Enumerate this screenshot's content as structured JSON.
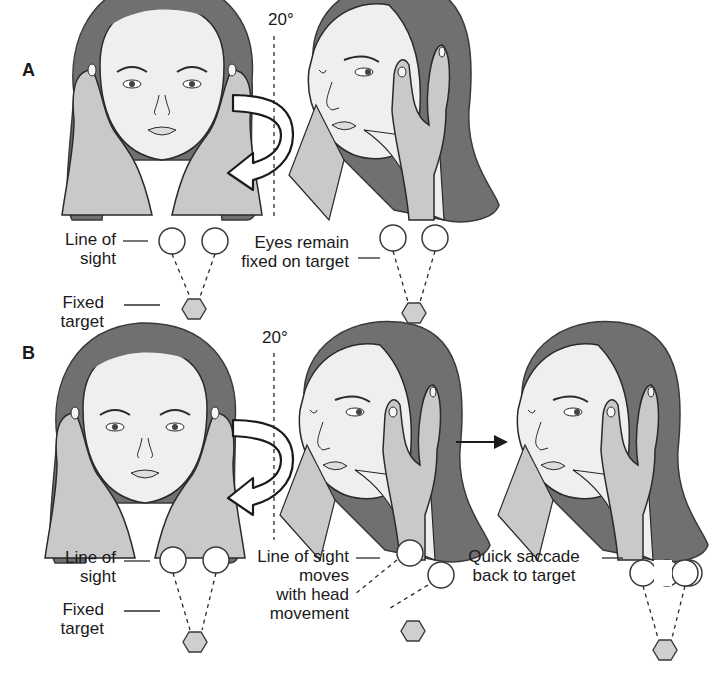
{
  "figure": {
    "panels": [
      {
        "id": "A",
        "letter": "A",
        "rotation_label": "20°",
        "labels": {
          "line_of_sight_1": "Line of",
          "line_of_sight_2": "sight",
          "fixed_target_1": "Fixed",
          "fixed_target_2": "target",
          "eyes_remain_1": "Eyes remain",
          "eyes_remain_2": "fixed on target"
        }
      },
      {
        "id": "B",
        "letter": "B",
        "rotation_label": "20°",
        "labels": {
          "line_of_sight_1": "Line of",
          "line_of_sight_2": "sight",
          "fixed_target_1": "Fixed",
          "fixed_target_2": "target",
          "moves_1": "Line of sight",
          "moves_2": "moves",
          "moves_3": "with head",
          "moves_4": "movement",
          "saccade_1": "Quick saccade",
          "saccade_2": "back to target"
        }
      }
    ],
    "colors": {
      "hair": "#707070",
      "skin": "#efefef",
      "hand": "#c9c9c9",
      "line": "#2a2a2a",
      "target": "#cfcfcf"
    }
  }
}
